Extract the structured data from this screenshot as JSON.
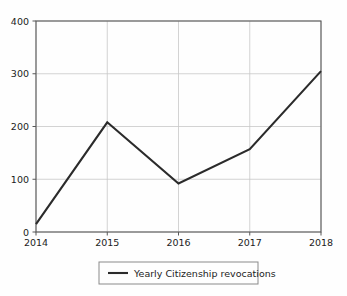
{
  "chart_data": {
    "type": "line",
    "title": "",
    "xlabel": "",
    "ylabel": "",
    "categories": [
      "2014",
      "2015",
      "2016",
      "2017",
      "2018"
    ],
    "x": [
      2014,
      2015,
      2016,
      2017,
      2018
    ],
    "series": [
      {
        "name": "Yearly Citizenship revocations",
        "values": [
          15,
          208,
          92,
          157,
          305
        ],
        "color": "#2b2b2b"
      }
    ],
    "xlim": [
      2014,
      2018
    ],
    "ylim": [
      0,
      400
    ],
    "yticks": [
      "0",
      "100",
      "200",
      "300",
      "400"
    ],
    "ytick_values": [
      0,
      100,
      200,
      300,
      400
    ],
    "xticks": [
      "2014",
      "2015",
      "2016",
      "2017",
      "2018"
    ],
    "grid": true,
    "grid_color": "#c8c8c8",
    "legend": {
      "position": "below-center",
      "entries": [
        {
          "label": "Yearly Citizenship revocations",
          "color": "#2b2b2b"
        }
      ]
    },
    "axis_color": "#555555",
    "background": "#fefefe"
  },
  "axes": {
    "y_tick_0": "0",
    "y_tick_1": "100",
    "y_tick_2": "200",
    "y_tick_3": "300",
    "y_tick_4": "400",
    "x_tick_0": "2014",
    "x_tick_1": "2015",
    "x_tick_2": "2016",
    "x_tick_3": "2017",
    "x_tick_4": "2018"
  },
  "legend": {
    "entry_0_label": "Yearly Citizenship revocations"
  }
}
